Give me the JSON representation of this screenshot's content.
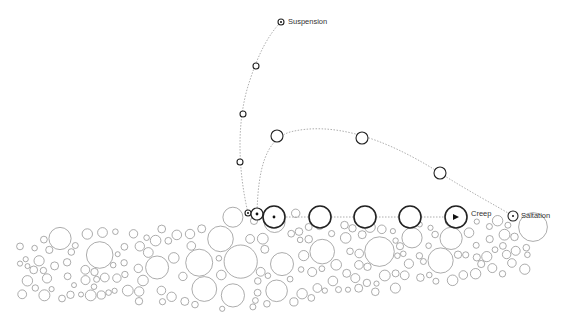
{
  "diagram": {
    "labels": {
      "suspension": "Suspension",
      "saltation": "Saltation",
      "creep": "Creep"
    },
    "colors": {
      "outline": "#222222",
      "bed": "#888888",
      "path": "#999999",
      "text": "#333333"
    },
    "particles": {
      "suspension": [
        {
          "x": 281,
          "y": 22,
          "r": 3
        },
        {
          "x": 256,
          "y": 66,
          "r": 3
        },
        {
          "x": 243,
          "y": 114,
          "r": 3
        },
        {
          "x": 240,
          "y": 162,
          "r": 3
        },
        {
          "x": 248,
          "y": 213,
          "r": 3
        }
      ],
      "saltation": [
        {
          "x": 277,
          "y": 136,
          "r": 6
        },
        {
          "x": 362,
          "y": 138,
          "r": 6
        },
        {
          "x": 440,
          "y": 173,
          "r": 6
        },
        {
          "x": 513,
          "y": 216,
          "r": 5
        }
      ],
      "creep": [
        {
          "x": 257,
          "y": 214,
          "r": 6
        },
        {
          "x": 274,
          "y": 217,
          "r": 11
        },
        {
          "x": 320,
          "y": 217,
          "r": 11
        },
        {
          "x": 365,
          "y": 217,
          "r": 11
        },
        {
          "x": 410,
          "y": 217,
          "r": 11
        },
        {
          "x": 456,
          "y": 217,
          "r": 11
        }
      ]
    }
  }
}
